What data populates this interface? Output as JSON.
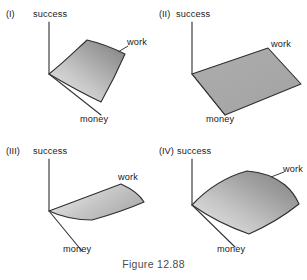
{
  "figure": {
    "caption": "Figure 12.88",
    "axis_labels": {
      "vertical": "success",
      "left_depth": "money",
      "right_depth": "work"
    },
    "colors": {
      "surface_light": "#dcdcdc",
      "surface_dark": "#8c8c8c",
      "surface_flat": "#a9a9a9",
      "axis": "#39393b",
      "edge": "#2e2e30",
      "text": "#202022",
      "caption_text": "#4c4c4e",
      "background": "#ffffff"
    },
    "panels": [
      {
        "id": "panel-1",
        "roman": "(I)",
        "success_label": "success",
        "money_label": "money",
        "work_label": "work",
        "surface_type": "steeply-rising-plane",
        "shading": "gradient light-lower-left to dark-upper-right",
        "has_work_leader_line": true
      },
      {
        "id": "panel-2",
        "roman": "(II)",
        "success_label": "success",
        "money_label": "money",
        "work_label": "work",
        "surface_type": "flat-horizontal-plane",
        "shading": "uniform medium gray",
        "has_work_leader_line": false
      },
      {
        "id": "panel-3",
        "roman": "(III)",
        "success_label": "success",
        "money_label": "money",
        "work_label": "work",
        "surface_type": "slightly-drooping-curved-sheet",
        "shading": "gradient light-left to medium-right",
        "has_work_leader_line": false
      },
      {
        "id": "panel-4",
        "roman": "(IV)",
        "success_label": "success",
        "money_label": "money",
        "work_label": "work",
        "surface_type": "convex-arched-curved-sheet",
        "shading": "gradient light-lower-left to dark-upper-right",
        "has_work_leader_line": true
      }
    ]
  },
  "chart_data": {
    "type": "surface-3d-multi",
    "title": "Figure 12.88",
    "xlabel": "money",
    "ylabel": "work",
    "zlabel": "success",
    "grid": false,
    "legend": "none",
    "panel_count": 4,
    "panels": [
      {
        "label": "(I)",
        "description": "success rises steeply with both money and work; steep planar sheet",
        "surface": "plane",
        "slope_money": "high",
        "slope_work": "high",
        "curvature": 0
      },
      {
        "label": "(II)",
        "description": "success constant at zero; flat plane lying in the money-work plane",
        "surface": "plane",
        "slope_money": 0,
        "slope_work": 0,
        "curvature": 0
      },
      {
        "label": "(III)",
        "description": "success nearly constant with a slight dip; gently drooping sheet",
        "surface": "curved",
        "slope_money": "low",
        "slope_work": "low",
        "curvature": "slightly negative"
      },
      {
        "label": "(IV)",
        "description": "success rises and arches over; convex curved sheet bending down at far work edge",
        "surface": "curved",
        "slope_money": "moderate",
        "slope_work": "high",
        "curvature": "negative (concave down)"
      }
    ]
  }
}
